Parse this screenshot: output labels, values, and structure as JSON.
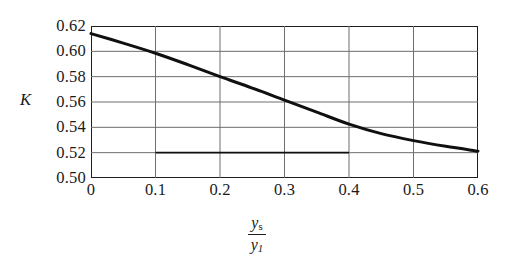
{
  "chart_data": {
    "type": "line",
    "title": "",
    "subtitle": "",
    "xlabel": "ys/y1",
    "ylabel": "K",
    "xlim": [
      0,
      0.6
    ],
    "ylim": [
      0.5,
      0.62
    ],
    "grid": "both",
    "legend": "none",
    "xticks": [
      "0",
      "0.1",
      "0.2",
      "0.3",
      "0.4",
      "0.5",
      "0.6"
    ],
    "xtick_values": [
      0,
      0.1,
      0.2,
      0.3,
      0.4,
      0.5,
      0.6
    ],
    "yticks": [
      "0.62",
      "0.60",
      "0.58",
      "0.56",
      "0.54",
      "0.52",
      "0.50"
    ],
    "ytick_values": [
      0.62,
      0.6,
      0.58,
      0.56,
      0.54,
      0.52,
      0.5
    ],
    "series": [
      {
        "name": "K curve",
        "kind": "curve",
        "color": "#101010",
        "linewidth": 3.0,
        "x": [
          0,
          0.05,
          0.1,
          0.15,
          0.2,
          0.25,
          0.3,
          0.35,
          0.4,
          0.45,
          0.5,
          0.55,
          0.6
        ],
        "values": [
          0.614,
          0.6065,
          0.5985,
          0.5895,
          0.58,
          0.571,
          0.5615,
          0.552,
          0.5425,
          0.535,
          0.5295,
          0.525,
          0.5212
        ]
      },
      {
        "name": "construction line",
        "kind": "horizontal-segment",
        "color": "#101010",
        "linewidth": 1.6,
        "y": 0.52,
        "x_start": 0.1,
        "x_end": 0.4
      }
    ]
  },
  "axis_labels": {
    "y_axis_name": "K",
    "x_axis_numerator": "y",
    "x_axis_numerator_sub": "s",
    "x_axis_denominator": "y",
    "x_axis_denominator_sub": "1"
  },
  "colors": {
    "frame": "#1d1d1d",
    "gridline": "#6e6e6e",
    "curve": "#101010",
    "background": "#ffffff"
  }
}
